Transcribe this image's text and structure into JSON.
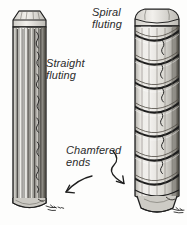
{
  "figure": {
    "background_color": "#fdfdfc",
    "ink_color": "#1e1e1e",
    "wood_fill_color": "#d9d7d1",
    "shadow_color": "#8d8b85"
  },
  "labels": {
    "straight_fluting": "Straight\nfluting",
    "spiral_fluting": "Spiral\nfluting",
    "chamfered_ends": "Chamfered\nends"
  },
  "parts": {
    "left_dowel": {
      "name": "Straight fluted dowel",
      "fluting_type": "straight",
      "flute_count": 11,
      "top_end": "chamfered",
      "bottom_end": "chamfered"
    },
    "right_dowel": {
      "name": "Spiral fluted dowel",
      "fluting_type": "spiral",
      "spiral_wrap_count": 7,
      "top_end": "chamfered",
      "bottom_end": "chamfered"
    }
  },
  "annotations": {
    "arrow_left": {
      "name": "arrow-to-left-dowel-end",
      "points_to": "left dowel chamfered bottom end"
    },
    "arrow_right": {
      "name": "arrow-to-right-dowel-end",
      "points_to": "right dowel chamfered bottom end"
    }
  }
}
